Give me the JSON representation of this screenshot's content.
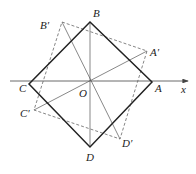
{
  "diagram": {
    "type": "geometry-rotation",
    "axis_label": "x",
    "origin_label": "O",
    "square": {
      "labels": {
        "A": "A",
        "B": "B",
        "C": "C",
        "D": "D"
      },
      "points": {
        "A": [
          152,
          82
        ],
        "B": [
          90,
          22
        ],
        "C": [
          29,
          84
        ],
        "D": [
          90,
          147
        ]
      }
    },
    "rotated_square": {
      "labels": {
        "A": "A′",
        "B": "B′",
        "C": "C′",
        "D": "D′"
      },
      "points": {
        "A": [
          147,
          51
        ],
        "B": [
          62,
          22
        ],
        "C": [
          34,
          110
        ],
        "D": [
          120,
          139
        ]
      }
    },
    "origin": [
      90,
      81
    ],
    "colors": {
      "solid": "#222222",
      "dashed": "#666666",
      "axis": "#444444"
    }
  }
}
